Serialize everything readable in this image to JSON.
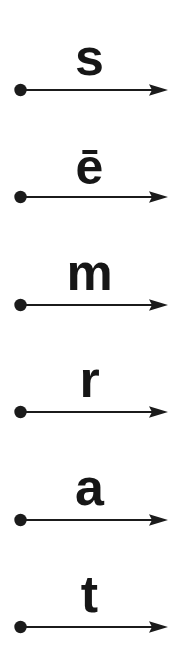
{
  "card": {
    "title": "Phoneme Arrow Strip",
    "background_color": "#ffffff",
    "ink_color": "#1b1b1b"
  },
  "arrow": {
    "dot_label": "start-dot",
    "shaft_label": "arrow-shaft",
    "head_label": "arrow-head",
    "direction": "left-to-right"
  },
  "rows": [
    {
      "letter": "s",
      "name": "phoneme-s",
      "has_macron": false
    },
    {
      "letter": "ē",
      "name": "phoneme-e-macron",
      "has_macron": true
    },
    {
      "letter": "m",
      "name": "phoneme-m",
      "has_macron": false
    },
    {
      "letter": "r",
      "name": "phoneme-r",
      "has_macron": false
    },
    {
      "letter": "a",
      "name": "phoneme-a",
      "has_macron": false
    },
    {
      "letter": "t",
      "name": "phoneme-t",
      "has_macron": false
    }
  ]
}
